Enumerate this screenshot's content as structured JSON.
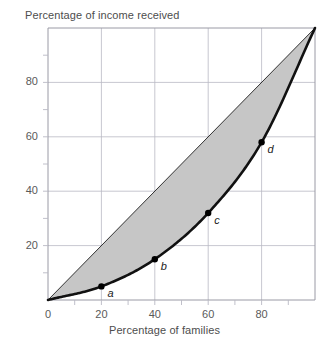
{
  "chart_data": {
    "type": "line",
    "title": "",
    "xlabel": "Percentage of families",
    "ylabel": "Percentage of income received",
    "xlim": [
      0,
      100
    ],
    "ylim": [
      0,
      100
    ],
    "grid": true,
    "legend": "none",
    "xticks": [
      {
        "value": 0,
        "label": "0"
      },
      {
        "value": 20,
        "label": "20"
      },
      {
        "value": 40,
        "label": "40"
      },
      {
        "value": 60,
        "label": "60"
      },
      {
        "value": 80,
        "label": "80"
      }
    ],
    "yticks": [
      {
        "value": 0,
        "label": ""
      },
      {
        "value": 20,
        "label": "20"
      },
      {
        "value": 40,
        "label": "40"
      },
      {
        "value": 60,
        "label": "60"
      },
      {
        "value": 80,
        "label": "80"
      }
    ],
    "minor_ticks": {
      "x": [
        10,
        30,
        50,
        70,
        90
      ],
      "y": [
        10,
        30,
        50,
        70,
        90
      ]
    },
    "series": [
      {
        "name": "Line of equality",
        "style": "thin-straight",
        "x": [
          0,
          100
        ],
        "values": [
          0,
          100
        ]
      },
      {
        "name": "Lorenz curve",
        "style": "thick-curve",
        "x": [
          0,
          20,
          40,
          60,
          80,
          100
        ],
        "values": [
          0,
          5,
          15,
          32,
          58,
          100
        ]
      }
    ],
    "points": [
      {
        "label": "a",
        "x": 20,
        "y": 5
      },
      {
        "label": "b",
        "x": 40,
        "y": 15
      },
      {
        "label": "c",
        "x": 60,
        "y": 32
      },
      {
        "label": "d",
        "x": 80,
        "y": 58
      }
    ],
    "shaded_region": {
      "name": "area-of-inequality",
      "between": [
        "Line of equality",
        "Lorenz curve"
      ],
      "color": "#c6c6c6"
    },
    "colors": {
      "curve": "#111111",
      "equality_line": "#333333",
      "grid": "#b9b9c4",
      "axis": "#9a9aa5",
      "shade": "#c6c6c6",
      "text": "#4d4d4d",
      "background": "#ffffff"
    }
  },
  "axis_titles": {
    "y": "Percentage of income received",
    "x": "Percentage of families"
  },
  "origin_label": "0"
}
